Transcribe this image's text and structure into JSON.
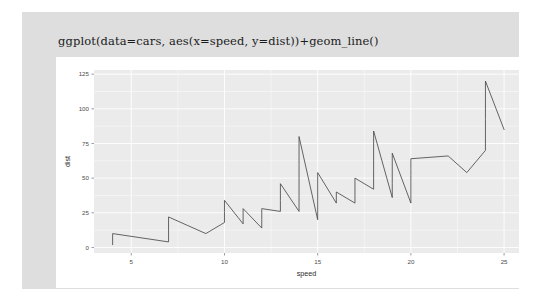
{
  "window": {
    "background_color": "#ffffff",
    "card_background_color": "#dedede",
    "plot_card_background_color": "#ffffff"
  },
  "code_cell": {
    "text": "ggplot(data=cars, aes(x=speed, y=dist))+geom_line()"
  },
  "chart_data": {
    "type": "line",
    "title": "",
    "xlabel": "speed",
    "ylabel": "dist",
    "xlim": [
      3.0,
      25.8
    ],
    "ylim": [
      -4,
      128
    ],
    "xticks": [
      5,
      10,
      15,
      20,
      25
    ],
    "yticks": [
      0,
      25,
      50,
      75,
      100,
      125
    ],
    "xtick_labels": [
      "5",
      "10",
      "15",
      "20",
      "25"
    ],
    "ytick_labels": [
      "0",
      "25",
      "50",
      "75",
      "100",
      "125"
    ],
    "grid": true,
    "grid_major_color": "#ffffff",
    "grid_minor_color": "#ffffff",
    "panel_color": "#ebebeb",
    "line_color": "#4a4a4a",
    "legend": "none",
    "series": [
      {
        "name": "dist",
        "x": [
          4,
          4,
          7,
          7,
          8,
          9,
          10,
          10,
          10,
          11,
          11,
          12,
          12,
          12,
          12,
          13,
          13,
          13,
          13,
          14,
          14,
          14,
          14,
          15,
          15,
          15,
          16,
          16,
          17,
          17,
          17,
          18,
          18,
          18,
          18,
          19,
          19,
          19,
          20,
          20,
          20,
          20,
          20,
          22,
          23,
          24,
          24,
          24,
          24,
          25
        ],
        "y": [
          2,
          10,
          4,
          22,
          16,
          10,
          18,
          26,
          34,
          17,
          28,
          14,
          20,
          24,
          28,
          26,
          34,
          34,
          46,
          26,
          36,
          60,
          80,
          20,
          26,
          54,
          32,
          40,
          32,
          40,
          50,
          42,
          56,
          76,
          84,
          36,
          46,
          68,
          32,
          48,
          52,
          56,
          64,
          66,
          54,
          70,
          92,
          93,
          120,
          85
        ]
      }
    ]
  }
}
